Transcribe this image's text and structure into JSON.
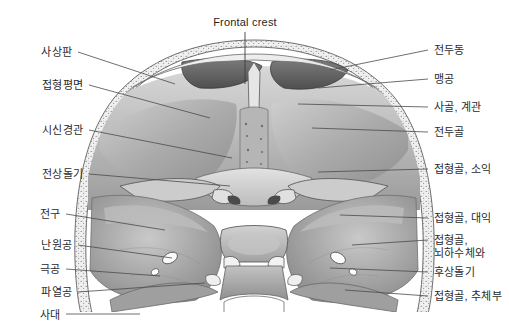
{
  "figure": {
    "title": "Frontal crest",
    "title_pos": {
      "x": 245,
      "y": 16
    },
    "background_color": "#ffffff",
    "line_color": "#4a4a4a",
    "text_color": "#2b2b2b"
  },
  "labels_left": [
    {
      "text": "사상판",
      "x": 72,
      "y": 46,
      "lead_x1": 78,
      "lead_y1": 52,
      "lead_x2": 175,
      "lead_y2": 84
    },
    {
      "text": "접형평면",
      "x": 83,
      "y": 79,
      "lead_x1": 89,
      "lead_y1": 85,
      "lead_x2": 210,
      "lead_y2": 118
    },
    {
      "text": "시신경관",
      "x": 83,
      "y": 124,
      "lead_x1": 89,
      "lead_y1": 130,
      "lead_x2": 232,
      "lead_y2": 158
    },
    {
      "text": "전상돌기",
      "x": 83,
      "y": 168,
      "lead_x1": 89,
      "lead_y1": 174,
      "lead_x2": 230,
      "lead_y2": 186
    },
    {
      "text": "전구",
      "x": 60,
      "y": 208,
      "lead_x1": 66,
      "lead_y1": 214,
      "lead_x2": 165,
      "lead_y2": 230
    },
    {
      "text": "난원공",
      "x": 72,
      "y": 239,
      "lead_x1": 78,
      "lead_y1": 245,
      "lead_x2": 172,
      "lead_y2": 258
    },
    {
      "text": "극공",
      "x": 60,
      "y": 263,
      "lead_x1": 66,
      "lead_y1": 269,
      "lead_x2": 160,
      "lead_y2": 276
    },
    {
      "text": "파열공",
      "x": 72,
      "y": 286,
      "lead_x1": 78,
      "lead_y1": 292,
      "lead_x2": 205,
      "lead_y2": 283
    },
    {
      "text": "사대",
      "x": 60,
      "y": 309,
      "lead_x1": 66,
      "lead_y1": 314,
      "lead_x2": 140,
      "lead_y2": 314
    }
  ],
  "labels_right": [
    {
      "text": "전두동",
      "x": 434,
      "y": 44,
      "lead_x1": 428,
      "lead_y1": 50,
      "lead_x2": 330,
      "lead_y2": 70
    },
    {
      "text": "맹공",
      "x": 434,
      "y": 73,
      "lead_x1": 428,
      "lead_y1": 79,
      "lead_x2": 318,
      "lead_y2": 88
    },
    {
      "text": "사골, 계관",
      "x": 434,
      "y": 101,
      "lead_x1": 428,
      "lead_y1": 107,
      "lead_x2": 298,
      "lead_y2": 104
    },
    {
      "text": "전두골",
      "x": 434,
      "y": 126,
      "lead_x1": 428,
      "lead_y1": 132,
      "lead_x2": 312,
      "lead_y2": 128
    },
    {
      "text": "접형골, 소익",
      "x": 434,
      "y": 163,
      "lead_x1": 428,
      "lead_y1": 169,
      "lead_x2": 318,
      "lead_y2": 172
    },
    {
      "text": "접형골, 대익",
      "x": 434,
      "y": 212,
      "lead_x1": 428,
      "lead_y1": 218,
      "lead_x2": 340,
      "lead_y2": 215
    },
    {
      "text": "접형골,\n뇌하수체와",
      "x": 434,
      "y": 234,
      "lead_x1": 428,
      "lead_y1": 240,
      "lead_x2": 352,
      "lead_y2": 245
    },
    {
      "text": "후상돌기",
      "x": 434,
      "y": 266,
      "lead_x1": 428,
      "lead_y1": 272,
      "lead_x2": 330,
      "lead_y2": 268
    },
    {
      "text": "접형골, 추체부",
      "x": 434,
      "y": 290,
      "lead_x1": 428,
      "lead_y1": 296,
      "lead_x2": 345,
      "lead_y2": 290
    }
  ]
}
